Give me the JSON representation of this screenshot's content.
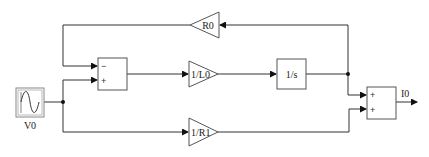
{
  "diagram": {
    "type": "block-diagram",
    "blocks": {
      "source": {
        "label": "V0",
        "icon": "sine-wave-icon"
      },
      "sum1": {
        "signs": [
          "−",
          "+"
        ]
      },
      "gain_r0": {
        "label": "R0"
      },
      "gain_l0": {
        "label": "1/L0"
      },
      "integrator": {
        "label": "1/s"
      },
      "gain_r1": {
        "label": "1/R1"
      },
      "sum2": {
        "signs": [
          "+",
          "+"
        ]
      },
      "output": {
        "label": "I0"
      }
    },
    "connections": [
      {
        "from": "V0",
        "to": "sum1.+"
      },
      {
        "from": "V0",
        "to": "1/R1"
      },
      {
        "from": "sum1",
        "to": "1/L0"
      },
      {
        "from": "1/L0",
        "to": "1/s"
      },
      {
        "from": "1/s",
        "to": "R0"
      },
      {
        "from": "R0",
        "to": "sum1.−"
      },
      {
        "from": "1/s",
        "to": "sum2.+ (1)"
      },
      {
        "from": "1/R1",
        "to": "sum2.+ (2)"
      },
      {
        "from": "sum2",
        "to": "I0"
      }
    ],
    "colors": {
      "line": "#333333",
      "block_border": "#555555",
      "background": "#ffffff"
    }
  }
}
